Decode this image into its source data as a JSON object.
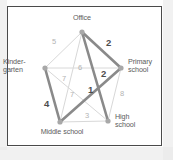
{
  "figure": {
    "type": "weighted-graph-diagram",
    "caption": ""
  },
  "nodes": [
    {
      "id": "office",
      "label": "Office",
      "x": 82,
      "y": 32
    },
    {
      "id": "primary",
      "label": "Primary\nschool",
      "label_line1": "Primary",
      "label_line2": "school",
      "x": 121,
      "y": 68
    },
    {
      "id": "kindergarten",
      "label": "Kinder-\ngarten",
      "label_line1": "Kinder-",
      "label_line2": "garten",
      "x": 45,
      "y": 68
    },
    {
      "id": "middle",
      "label": "Middle school",
      "x": 60,
      "y": 122
    },
    {
      "id": "high",
      "label": "High\nschool",
      "label_line1": "High",
      "label_line2": "school",
      "x": 108,
      "y": 121
    }
  ],
  "edges": [
    {
      "from": "kindergarten",
      "to": "office",
      "weight": "5",
      "highlighted": false,
      "label_x": 52,
      "label_y": 38
    },
    {
      "from": "office",
      "to": "primary",
      "weight": "2",
      "highlighted": true,
      "label_x": 106,
      "label_y": 39
    },
    {
      "from": "office",
      "to": "middle",
      "weight": "6",
      "highlighted": false,
      "label_x": 78,
      "label_y": 64
    },
    {
      "from": "kindergarten",
      "to": "primary",
      "weight": "7",
      "highlighted": false,
      "label_x": 62,
      "label_y": 75
    },
    {
      "from": "primary",
      "to": "middle",
      "weight": "2",
      "highlighted": true,
      "label_x": 101,
      "label_y": 70
    },
    {
      "from": "kindergarten",
      "to": "high",
      "weight": "7",
      "highlighted": false,
      "label_x": 70,
      "label_y": 91
    },
    {
      "from": "office",
      "to": "high",
      "weight": "1",
      "highlighted": true,
      "label_x": 88,
      "label_y": 86
    },
    {
      "from": "primary",
      "to": "high",
      "weight": "8",
      "highlighted": false,
      "label_x": 120,
      "label_y": 90
    },
    {
      "from": "kindergarten",
      "to": "middle",
      "weight": "4",
      "highlighted": true,
      "label_x": 44,
      "label_y": 100
    },
    {
      "from": "middle",
      "to": "high",
      "weight": "3",
      "highlighted": false,
      "label_x": 85,
      "label_y": 112
    }
  ],
  "colors": {
    "edge_light": "#d8d8d8",
    "edge_highlight": "#8a8a8a",
    "node_fill": "#a8a8a8",
    "label_text": "#5c5c5c",
    "weight_light": "#b3b3b3",
    "weight_bold": "#4d4d4d",
    "frame": "#4a4a4a",
    "background": "#ffffff"
  }
}
